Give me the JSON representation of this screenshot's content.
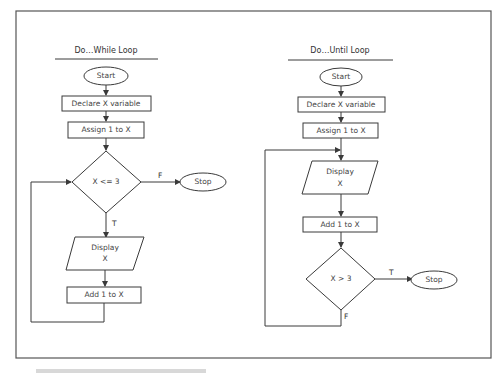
{
  "left_chart": {
    "title": "Do…While Loop",
    "start": "Start",
    "declare": "Declare X variable",
    "assign": "Assign 1 to X",
    "condition": "X <= 3",
    "false_label": "F",
    "true_label": "T",
    "stop": "Stop",
    "display_line1": "Display",
    "display_line2": "X",
    "increment": "Add 1 to X"
  },
  "right_chart": {
    "title": "Do…Until Loop",
    "start": "Start",
    "declare": "Declare X variable",
    "assign": "Assign 1 to X",
    "display_line1": "Display",
    "display_line2": "X",
    "increment": "Add 1 to X",
    "condition": "X > 3",
    "true_label": "T",
    "false_label": "F",
    "stop": "Stop"
  },
  "colors": {
    "stroke": "#3a3a3a",
    "background": "#ffffff"
  }
}
